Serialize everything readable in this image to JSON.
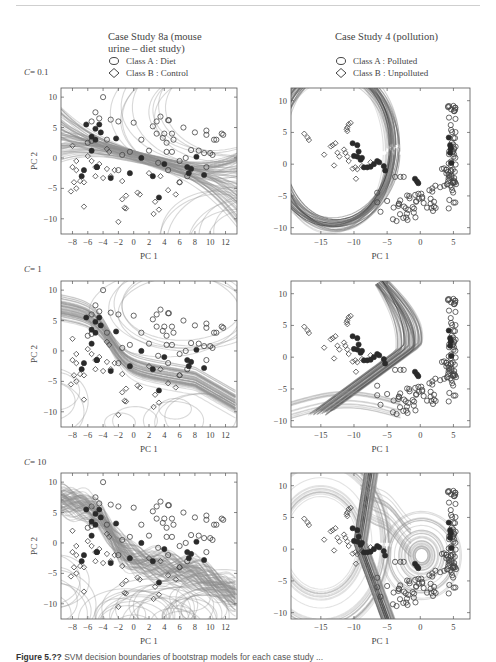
{
  "columns": [
    {
      "title_line1": "Case Study 8a (mouse",
      "title_line2": "urine – diet study)",
      "legend": [
        {
          "marker": "circle",
          "label": "Class A : Diet"
        },
        {
          "marker": "diamond",
          "label": "Class B : Control"
        }
      ]
    },
    {
      "title_line1": "Case Study 4 (pollution)",
      "title_line2": "",
      "legend": [
        {
          "marker": "circle",
          "label": "Class A : Polluted"
        },
        {
          "marker": "diamond",
          "label": "Class B : Unpolluted"
        }
      ]
    }
  ],
  "rows": [
    {
      "c_label": "C",
      "c_value": "= 0.1"
    },
    {
      "c_label": "C",
      "c_value": "= 1"
    },
    {
      "c_label": "C",
      "c_value": "= 10"
    }
  ],
  "caption": {
    "bold": "Figure 5.??",
    "text": "  SVM decision boundaries of bootstrap models for each case study ..."
  },
  "chart_data": [
    {
      "type": "scatter",
      "title": "Case Study 8a (mouse urine – diet study)",
      "panel": "C = 0.1",
      "xlabel": "PC 1",
      "ylabel": "PC 2",
      "xlim": [
        -9.5,
        13.5
      ],
      "ylim": [
        -12.5,
        11.5
      ],
      "xticks": [
        -8,
        -6,
        -4,
        -2,
        0,
        2,
        4,
        6,
        8,
        10,
        12
      ],
      "yticks": [
        -10,
        -5,
        0,
        5,
        10
      ],
      "legend": [
        "Class A : Diet",
        "Class B : Control"
      ],
      "boundary": "many grey bootstrap boundaries, roughly linear band from upper-left (-9,3) to lower-right (13,-5)"
    },
    {
      "type": "scatter",
      "title": "Case Study 4 (pollution)",
      "panel": "C = 0.1",
      "xlabel": "PC 1",
      "ylabel": "PC 2",
      "xlim": [
        -19.5,
        7.5
      ],
      "ylim": [
        -11,
        12
      ],
      "xticks": [
        -15,
        -10,
        -5,
        0,
        5
      ],
      "yticks": [
        -10,
        -5,
        0,
        5,
        10
      ],
      "legend": [
        "Class A : Polluted",
        "Class B : Unpolluted"
      ],
      "boundary": "dark closed elliptical band enclosing left region, centred near (-13,2)"
    },
    {
      "type": "scatter",
      "title": "Case Study 8a (mouse urine – diet study)",
      "panel": "C = 1",
      "xlabel": "PC 1",
      "ylabel": "PC 2",
      "xlim": [
        -9.5,
        13.5
      ],
      "ylim": [
        -12.5,
        11.5
      ],
      "xticks": [
        -8,
        -6,
        -4,
        -2,
        0,
        2,
        4,
        6,
        8,
        10,
        12
      ],
      "yticks": [
        -10,
        -5,
        0,
        5,
        10
      ],
      "boundary": "S-shaped band from (-9,10) through (0,0) to (13,-4)"
    },
    {
      "type": "scatter",
      "title": "Case Study 4 (pollution)",
      "panel": "C = 1",
      "xlabel": "PC 1",
      "ylabel": "PC 2",
      "xlim": [
        -19.5,
        7.5
      ],
      "ylim": [
        -11,
        12
      ],
      "xticks": [
        -15,
        -10,
        -5,
        0,
        5
      ],
      "yticks": [
        -10,
        -5,
        0,
        5,
        10
      ],
      "boundary": "curved bundle descending from top near x=-6 looping left to (-19,-8)"
    },
    {
      "type": "scatter",
      "title": "Case Study 8a (mouse urine – diet study)",
      "panel": "C = 10",
      "xlabel": "PC 1",
      "ylabel": "PC 2",
      "xlim": [
        -9.5,
        13.5
      ],
      "ylim": [
        -12.5,
        11.5
      ],
      "xticks": [
        -8,
        -6,
        -4,
        -2,
        0,
        2,
        4,
        6,
        8,
        10,
        12
      ],
      "yticks": [
        -10,
        -5,
        0,
        5,
        10
      ],
      "boundary": "wiggly S-shaped band with many closed loops in lower half"
    },
    {
      "type": "scatter",
      "title": "Case Study 4 (pollution)",
      "panel": "C = 10",
      "xlabel": "PC 1",
      "ylabel": "PC 2",
      "xlim": [
        -19.5,
        7.5
      ],
      "ylim": [
        -11,
        12
      ],
      "xticks": [
        -15,
        -10,
        -5,
        0,
        5
      ],
      "yticks": [
        -10,
        -5,
        0,
        5,
        10
      ],
      "boundary": "dark vertical band near x=-9 plus concentric loops around (0,-1)"
    }
  ]
}
